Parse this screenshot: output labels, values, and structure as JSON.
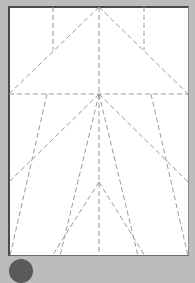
{
  "diagram": {
    "type": "origami-crease-pattern",
    "paper": {
      "x": 8,
      "y": 6,
      "width": 181,
      "height": 250,
      "color": "#ffffff",
      "border_color": "#4a4a4a"
    },
    "background_color": "#bcbcbc",
    "crease_color": "#9a9a9a",
    "crease_style": "dashed",
    "creases": [
      {
        "x1": 99,
        "y1": 7,
        "x2": 99,
        "y2": 256
      },
      {
        "x1": 9,
        "y1": 94,
        "x2": 188,
        "y2": 94
      },
      {
        "x1": 99,
        "y1": 7,
        "x2": 9,
        "y2": 94
      },
      {
        "x1": 99,
        "y1": 7,
        "x2": 188,
        "y2": 94
      },
      {
        "x1": 53,
        "y1": 7,
        "x2": 53,
        "y2": 50
      },
      {
        "x1": 144,
        "y1": 7,
        "x2": 144,
        "y2": 50
      },
      {
        "x1": 99,
        "y1": 94,
        "x2": 9,
        "y2": 182
      },
      {
        "x1": 99,
        "y1": 94,
        "x2": 188,
        "y2": 182
      },
      {
        "x1": 47,
        "y1": 94,
        "x2": 10,
        "y2": 256
      },
      {
        "x1": 151,
        "y1": 94,
        "x2": 188,
        "y2": 256
      },
      {
        "x1": 99,
        "y1": 94,
        "x2": 60,
        "y2": 256
      },
      {
        "x1": 99,
        "y1": 94,
        "x2": 138,
        "y2": 256
      },
      {
        "x1": 99,
        "y1": 182,
        "x2": 52,
        "y2": 256
      },
      {
        "x1": 99,
        "y1": 182,
        "x2": 145,
        "y2": 256
      }
    ]
  }
}
